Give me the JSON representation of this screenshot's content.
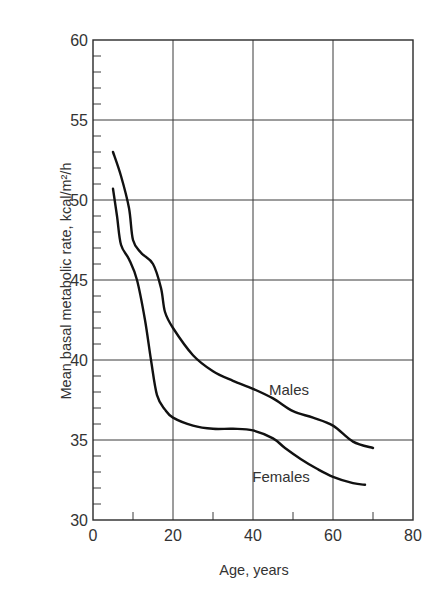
{
  "chart_data": {
    "type": "line",
    "title": "",
    "xlabel": "Age, years",
    "ylabel": "Mean basal metabolic rate, kcal/m²/h",
    "xlim": [
      0,
      80
    ],
    "ylim": [
      30,
      60
    ],
    "x_ticks": [
      "0",
      "20",
      "40",
      "60",
      "80"
    ],
    "y_ticks": [
      "30",
      "35",
      "40",
      "45",
      "50",
      "55",
      "60"
    ],
    "x_minor_tick_interval": 10,
    "y_minor_tick_interval": 1,
    "grid": true,
    "legend": "inline labels",
    "series": [
      {
        "name": "Males",
        "label_position": {
          "x": 49,
          "y": 37.8
        },
        "points": [
          [
            5,
            53.0
          ],
          [
            7,
            51.5
          ],
          [
            9,
            49.5
          ],
          [
            10,
            47.5
          ],
          [
            12,
            46.7
          ],
          [
            15,
            46.0
          ],
          [
            17,
            44.5
          ],
          [
            18,
            43.0
          ],
          [
            20,
            42.0
          ],
          [
            25,
            40.3
          ],
          [
            30,
            39.3
          ],
          [
            35,
            38.7
          ],
          [
            40,
            38.2
          ],
          [
            45,
            37.6
          ],
          [
            50,
            36.8
          ],
          [
            55,
            36.4
          ],
          [
            60,
            35.9
          ],
          [
            65,
            34.9
          ],
          [
            70,
            34.5
          ]
        ]
      },
      {
        "name": "Females",
        "label_position": {
          "x": 47,
          "y": 32.4
        },
        "points": [
          [
            5,
            50.7
          ],
          [
            6,
            49.0
          ],
          [
            7,
            47.2
          ],
          [
            9,
            46.3
          ],
          [
            11,
            45.0
          ],
          [
            13,
            42.5
          ],
          [
            14.5,
            40.0
          ],
          [
            16,
            37.8
          ],
          [
            18,
            36.9
          ],
          [
            20,
            36.4
          ],
          [
            25,
            35.9
          ],
          [
            30,
            35.7
          ],
          [
            35,
            35.7
          ],
          [
            40,
            35.6
          ],
          [
            45,
            35.1
          ],
          [
            48,
            34.5
          ],
          [
            52,
            33.8
          ],
          [
            56,
            33.2
          ],
          [
            60,
            32.7
          ],
          [
            65,
            32.3
          ],
          [
            68,
            32.2
          ]
        ]
      }
    ]
  }
}
